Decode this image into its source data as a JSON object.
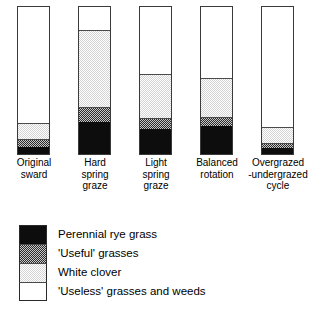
{
  "chart_data": {
    "type": "bar",
    "title": "",
    "subtitle": "",
    "xlabel": "",
    "ylabel": "",
    "ylim": [
      0,
      100
    ],
    "grid": false,
    "stacked": true,
    "orientation": "vertical",
    "legend_position": "below-left",
    "units": "percent of sward composition",
    "categories": [
      "Original\nsward",
      "Hard\nspring\ngraze",
      "Light\nspring\ngraze",
      "Balanced\nrotation",
      "Overgrazed\n-undergrazed\ncycle"
    ],
    "series": [
      {
        "name": "Perennial rye grass",
        "key": "rye",
        "color": "#0d0d0d",
        "pattern": "solid-black",
        "values": [
          5,
          22,
          17,
          19,
          4
        ]
      },
      {
        "name": "'Useful' grasses",
        "key": "useful",
        "color": "#2b2b2b",
        "pattern": "dark-checker",
        "values": [
          5,
          10,
          7,
          6,
          3
        ]
      },
      {
        "name": "White clover",
        "key": "clover",
        "color": "#d4d4d4",
        "pattern": "light-checker",
        "values": [
          10,
          52,
          30,
          26,
          10
        ]
      },
      {
        "name": "'Useless' grasses and weeds",
        "key": "useless",
        "color": "#ffffff",
        "pattern": "blank-white",
        "values": [
          80,
          16,
          46,
          49,
          83
        ]
      }
    ]
  },
  "plot": {
    "bars": [
      {
        "label": "Original\nsward",
        "segments": [
          {
            "key": "useless",
            "percent": 80
          },
          {
            "key": "clover",
            "percent": 10
          },
          {
            "key": "useful",
            "percent": 5
          },
          {
            "key": "rye",
            "percent": 5
          }
        ]
      },
      {
        "label": "Hard\nspring\ngraze",
        "segments": [
          {
            "key": "useless",
            "percent": 16
          },
          {
            "key": "clover",
            "percent": 52
          },
          {
            "key": "useful",
            "percent": 10
          },
          {
            "key": "rye",
            "percent": 22
          }
        ]
      },
      {
        "label": "Light\nspring\ngraze",
        "segments": [
          {
            "key": "useless",
            "percent": 46
          },
          {
            "key": "clover",
            "percent": 30
          },
          {
            "key": "useful",
            "percent": 7
          },
          {
            "key": "rye",
            "percent": 17
          }
        ]
      },
      {
        "label": "Balanced\nrotation",
        "segments": [
          {
            "key": "useless",
            "percent": 49
          },
          {
            "key": "clover",
            "percent": 26
          },
          {
            "key": "useful",
            "percent": 6
          },
          {
            "key": "rye",
            "percent": 19
          }
        ]
      },
      {
        "label": "Overgrazed\n-undergrazed\ncycle",
        "segments": [
          {
            "key": "useless",
            "percent": 83
          },
          {
            "key": "clover",
            "percent": 10
          },
          {
            "key": "useful",
            "percent": 3
          },
          {
            "key": "rye",
            "percent": 4
          }
        ]
      }
    ]
  },
  "legend": {
    "items": [
      {
        "label": "Perennial rye grass",
        "key": "rye"
      },
      {
        "label": "'Useful' grasses",
        "key": "useful"
      },
      {
        "label": "White clover",
        "key": "clover"
      },
      {
        "label": "'Useless' grasses and weeds",
        "key": "useless"
      }
    ]
  }
}
